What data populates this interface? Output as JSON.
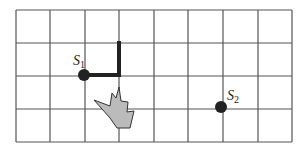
{
  "diagram": {
    "type": "grid-path",
    "grid": {
      "columns": 8,
      "rows": 4,
      "x_lines": [
        16,
        50,
        85,
        119,
        154,
        188,
        223,
        258,
        292
      ],
      "y_lines": [
        10,
        43,
        76,
        109,
        142
      ],
      "line_color": "#555555"
    },
    "points": [
      {
        "id": "S1",
        "label": "S",
        "subscript": "1",
        "x": 84,
        "y": 75,
        "label_x": 73,
        "label_y": 65
      },
      {
        "id": "S2",
        "label": "S",
        "subscript": "2",
        "x": 221,
        "y": 107,
        "label_x": 227,
        "label_y": 100
      }
    ],
    "path": {
      "description": "thick path from S1 right one cell then up one cell",
      "points": [
        [
          84,
          75
        ],
        [
          119,
          75
        ],
        [
          119,
          43
        ]
      ],
      "color": "#222222",
      "width": 4
    },
    "obstacle": {
      "description": "gray flame / hazard shape",
      "fill": "#bbbbbb",
      "stroke": "#333333",
      "points": "94,100 110,106 112,93 116,98 119,87 121,101 128,102 127,112 134,111 130,128 117,128 110,118"
    }
  }
}
